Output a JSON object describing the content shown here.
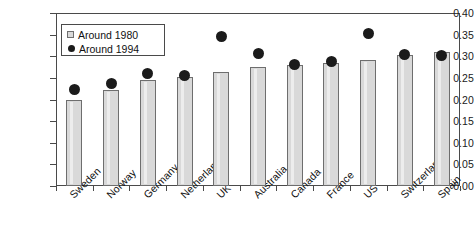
{
  "chart_data": {
    "type": "bar",
    "title": "",
    "subtitle": "",
    "xlabel": "",
    "ylabel": "",
    "ylim": [
      0.0,
      0.4
    ],
    "yticks": [
      "0.00",
      "0.05",
      "0.10",
      "0.15",
      "0.20",
      "0.25",
      "0.30",
      "0.35",
      "0.40"
    ],
    "grid": false,
    "legend_position": "upper-left-inside",
    "categories": [
      "Sweden",
      "Norway",
      "Germany",
      "Netherlands",
      "UK",
      "Australia",
      "Canada",
      "France",
      "US",
      "Switzerland",
      "Spain"
    ],
    "series": [
      {
        "name": "Around 1980",
        "marker": "square",
        "render": "bar",
        "color": "#d9d9d9",
        "values": [
          0.198,
          0.222,
          0.244,
          0.253,
          0.264,
          0.275,
          0.279,
          0.285,
          0.292,
          0.303,
          0.31
        ]
      },
      {
        "name": "Around 1994",
        "marker": "circle",
        "render": "point",
        "color": "#1b1b1b",
        "values": [
          0.224,
          0.237,
          0.26,
          0.256,
          0.345,
          0.307,
          0.281,
          0.288,
          0.352,
          0.305,
          0.302
        ]
      }
    ]
  },
  "legend": {
    "items": [
      {
        "label": "Around 1980",
        "marker": "square"
      },
      {
        "label": "Around 1994",
        "marker": "circle"
      }
    ]
  },
  "colors": {
    "bar_fill": "#d9d9d9",
    "bar_stroke": "#6e6e6e",
    "dot": "#1b1b1b",
    "axis": "#4a4a4a",
    "text": "#111111"
  }
}
